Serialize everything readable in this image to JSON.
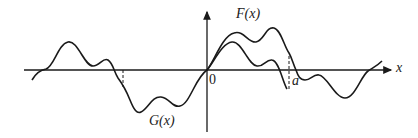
{
  "figure": {
    "labels": {
      "F": "F(x)",
      "G": "G(x)",
      "origin": "0",
      "a": "a",
      "x_axis": "x"
    },
    "colors": {
      "ink": "#1a1a1a",
      "background": "#ffffff"
    }
  }
}
